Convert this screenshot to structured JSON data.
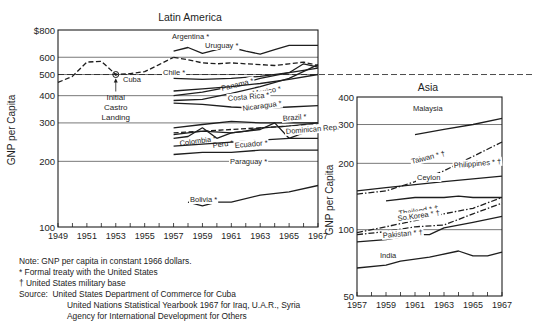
{
  "chart_data": [
    {
      "type": "line",
      "title": "Latin America",
      "xlabel": "",
      "ylabel": "GNP per Capita",
      "yscale": "log",
      "ylim": [
        100,
        800
      ],
      "xlim": [
        1949,
        1967
      ],
      "y_ticks": [
        {
          "value": 800,
          "label": "$800"
        },
        {
          "value": 600,
          "label": "600"
        },
        {
          "value": 500,
          "label": "500"
        },
        {
          "value": 400,
          "label": "400"
        },
        {
          "value": 300,
          "label": "300"
        },
        {
          "value": 200,
          "label": "200"
        },
        {
          "value": 100,
          "label": "100"
        }
      ],
      "x_tick_labels": [
        "1949",
        "1951",
        "1953",
        "1955",
        "1957",
        "1959",
        "1961",
        "1963",
        "1965",
        "1967"
      ],
      "reference_line": {
        "value": 500,
        "style": "dashed",
        "extends_into": "Asia"
      },
      "annotation": {
        "text_lines": [
          "Initial",
          "Castro",
          "Landing"
        ],
        "year": 1953,
        "value": 500,
        "marker_label": "Cuba"
      },
      "series": [
        {
          "name": "Cuba",
          "style": "dashed",
          "x": [
            1949,
            1950,
            1951,
            1952,
            1953,
            1954,
            1955,
            1956,
            1957
          ],
          "values": [
            460,
            490,
            570,
            575,
            500,
            505,
            515,
            555,
            600
          ]
        },
        {
          "name": "Argentina *",
          "style": "solid",
          "x": [
            1957,
            1958,
            1959,
            1960,
            1961,
            1962,
            1963,
            1964,
            1965,
            1966,
            1967
          ],
          "values": [
            640,
            665,
            625,
            650,
            665,
            640,
            620,
            650,
            680,
            680,
            680
          ]
        },
        {
          "name": "Uruguay *",
          "style": "dashed",
          "x": [
            1957,
            1958,
            1959,
            1960,
            1961,
            1962,
            1963,
            1964,
            1965,
            1966,
            1967
          ],
          "values": [
            600,
            585,
            565,
            560,
            565,
            560,
            555,
            550,
            560,
            570,
            550
          ]
        },
        {
          "name": "Chile *",
          "style": "solid",
          "x": [
            1957,
            1959,
            1961,
            1963,
            1965,
            1967
          ],
          "values": [
            480,
            475,
            480,
            490,
            510,
            535
          ]
        },
        {
          "name": "Panama *",
          "style": "solid",
          "x": [
            1957,
            1959,
            1961,
            1963,
            1965,
            1966,
            1967
          ],
          "values": [
            400,
            415,
            440,
            480,
            510,
            560,
            540
          ]
        },
        {
          "name": "Mexico *",
          "style": "solid",
          "x": [
            1957,
            1959,
            1961,
            1963,
            1965,
            1967
          ],
          "values": [
            420,
            430,
            440,
            455,
            475,
            500
          ]
        },
        {
          "name": "Costa Rica *",
          "style": "solid",
          "x": [
            1957,
            1959,
            1961,
            1963,
            1965,
            1967
          ],
          "values": [
            380,
            385,
            410,
            440,
            480,
            555
          ]
        },
        {
          "name": "Nicaragua *",
          "style": "solid",
          "x": [
            1957,
            1959,
            1961,
            1963,
            1965,
            1967
          ],
          "values": [
            370,
            365,
            355,
            350,
            355,
            360
          ]
        },
        {
          "name": "Brazil *",
          "style": "solid",
          "x": [
            1957,
            1959,
            1961,
            1963,
            1965,
            1967
          ],
          "values": [
            285,
            295,
            305,
            300,
            300,
            300
          ]
        },
        {
          "name": "Colombia *",
          "style": "dashed",
          "x": [
            1957,
            1959,
            1961,
            1963,
            1965,
            1967
          ],
          "values": [
            270,
            275,
            280,
            285,
            290,
            295
          ]
        },
        {
          "name": "Peru *",
          "style": "solid",
          "x": [
            1957,
            1958,
            1959,
            1960,
            1961,
            1962,
            1963,
            1965,
            1967
          ],
          "values": [
            255,
            260,
            285,
            255,
            270,
            275,
            285,
            290,
            300
          ]
        },
        {
          "name": "Ecuador *",
          "style": "solid",
          "x": [
            1957,
            1959,
            1961,
            1963,
            1965,
            1967
          ],
          "values": [
            235,
            240,
            245,
            250,
            255,
            255
          ]
        },
        {
          "name": "Dominican Rep.",
          "style": "solid",
          "x": [
            1957,
            1959,
            1961,
            1963,
            1964,
            1965,
            1966,
            1967
          ],
          "values": [
            265,
            275,
            270,
            280,
            300,
            255,
            270,
            280
          ]
        },
        {
          "name": "Paraguay *",
          "style": "solid",
          "x": [
            1957,
            1959,
            1961,
            1963,
            1965,
            1967
          ],
          "values": [
            215,
            220,
            220,
            225,
            225,
            225
          ]
        },
        {
          "name": "Bolivia *",
          "style": "solid",
          "x": [
            1958,
            1959,
            1960,
            1961,
            1963,
            1965,
            1967
          ],
          "values": [
            130,
            125,
            130,
            130,
            140,
            145,
            155
          ]
        }
      ]
    },
    {
      "type": "line",
      "title": "Asia",
      "xlabel": "",
      "ylabel": "GNP per Capita",
      "yscale": "log",
      "ylim": [
        50,
        400
      ],
      "xlim": [
        1957,
        1967
      ],
      "y_ticks": [
        {
          "value": 400,
          "label": "400"
        },
        {
          "value": 300,
          "label": "300"
        },
        {
          "value": 200,
          "label": "200"
        },
        {
          "value": 100,
          "label": "100"
        },
        {
          "value": 50,
          "label": "50"
        }
      ],
      "x_tick_labels": [
        "1957",
        "1959",
        "1961",
        "1963",
        "1965",
        "1967"
      ],
      "series": [
        {
          "name": "Malaysia",
          "style": "solid",
          "x": [
            1961,
            1963,
            1965,
            1967
          ],
          "values": [
            270,
            285,
            300,
            320
          ]
        },
        {
          "name": "Taiwan * †",
          "style": "dash-dot",
          "x": [
            1957,
            1959,
            1961,
            1963,
            1965,
            1967
          ],
          "values": [
            145,
            150,
            165,
            185,
            215,
            250
          ]
        },
        {
          "name": "Philippines * †",
          "style": "solid",
          "x": [
            1957,
            1959,
            1961,
            1963,
            1965,
            1967
          ],
          "values": [
            150,
            155,
            160,
            165,
            170,
            175
          ]
        },
        {
          "name": "Ceylon",
          "style": "solid",
          "x": [
            1959,
            1961,
            1963,
            1964,
            1965,
            1967
          ],
          "values": [
            135,
            140,
            140,
            142,
            140,
            140
          ]
        },
        {
          "name": "Thailand * †",
          "style": "dash-dot",
          "x": [
            1957,
            1959,
            1961,
            1963,
            1965,
            1967
          ],
          "values": [
            97,
            103,
            110,
            118,
            125,
            140
          ]
        },
        {
          "name": "So.Korea * †",
          "style": "dash-dot",
          "x": [
            1957,
            1959,
            1961,
            1963,
            1965,
            1967
          ],
          "values": [
            95,
            98,
            103,
            105,
            118,
            132
          ]
        },
        {
          "name": "Pakistan * †",
          "style": "solid",
          "x": [
            1957,
            1959,
            1961,
            1962,
            1963,
            1965,
            1967
          ],
          "values": [
            88,
            90,
            95,
            95,
            102,
            108,
            115
          ]
        },
        {
          "name": "India",
          "style": "solid",
          "x": [
            1957,
            1959,
            1960,
            1962,
            1964,
            1965,
            1966,
            1967
          ],
          "values": [
            67,
            69,
            72,
            75,
            80,
            76,
            76,
            79
          ]
        }
      ]
    }
  ],
  "notes": {
    "note": "Note: GNP per capita in constant 1966 dollars.",
    "asterisk": "* Formal treaty with the United States",
    "dagger": "† United States military base",
    "source_label": "Source:",
    "source_1": "United States Department of Commerce for Cuba",
    "source_2": "United Nations Statistical Yearbook 1967 for Iraq, U.A.R., Syria",
    "source_3": "Agency for International Development for Others"
  }
}
